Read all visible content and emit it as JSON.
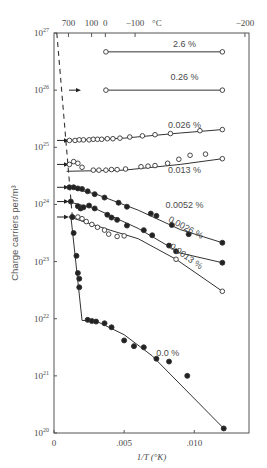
{
  "chart_data": {
    "type": "scatter",
    "title": "",
    "xlabel": "1/T (°K)",
    "ylabel": "Charge carriers per/m³",
    "x_scale": "linear",
    "y_scale": "log",
    "xlim": [
      0,
      0.0139
    ],
    "ylim": [
      1e+20,
      1e+27
    ],
    "x_ticks": [
      {
        "value": 0,
        "label": "0"
      },
      {
        "value": 0.005,
        "label": ".005"
      },
      {
        "value": 0.01,
        "label": ".010"
      }
    ],
    "y_ticks": [
      {
        "exp": 27,
        "label": "10",
        "sup": "27"
      },
      {
        "exp": 26,
        "label": "10",
        "sup": "26"
      },
      {
        "exp": 25,
        "label": "10",
        "sup": "25"
      },
      {
        "exp": 24,
        "label": "10",
        "sup": "24"
      },
      {
        "exp": 23,
        "label": "10",
        "sup": "23"
      },
      {
        "exp": 22,
        "label": "10",
        "sup": "22"
      },
      {
        "exp": 21,
        "label": "10",
        "sup": "21"
      },
      {
        "exp": 20,
        "label": "10",
        "sup": "20"
      }
    ],
    "top_axis": {
      "unit": "°C",
      "ticks": [
        {
          "label": "700",
          "inv_T": 0.00103
        },
        {
          "label": "100",
          "inv_T": 0.00268
        },
        {
          "label": "0",
          "inv_T": 0.00366
        },
        {
          "label": "−100",
          "inv_T": 0.00578
        },
        {
          "label": "−200",
          "inv_T": 0.01361
        }
      ]
    },
    "grid": false,
    "legend": "inline labels",
    "series": [
      {
        "name": "2.6 %",
        "marker": "open",
        "label_pos": [
          0.0093,
          26.75
        ],
        "points": [
          [
            0.0037,
            26.67
          ],
          [
            0.012,
            26.67
          ]
        ],
        "curve": [
          [
            0.0037,
            26.67
          ],
          [
            0.012,
            26.67
          ]
        ]
      },
      {
        "name": "0.26 %",
        "marker": "open",
        "label_pos": [
          0.0093,
          26.17
        ],
        "points": [
          [
            0.0037,
            26.0
          ],
          [
            0.012,
            26.0
          ]
        ],
        "curve": [
          [
            0.0037,
            26.0
          ],
          [
            0.012,
            26.0
          ]
        ]
      },
      {
        "name": "0.026 %",
        "marker": "open",
        "label_pos": [
          0.0093,
          25.33
        ],
        "points": [
          [
            0.0011,
            25.12
          ],
          [
            0.0015,
            25.12
          ],
          [
            0.0018,
            25.13
          ],
          [
            0.0021,
            25.13
          ],
          [
            0.0025,
            25.13
          ],
          [
            0.0028,
            25.14
          ],
          [
            0.0031,
            25.14
          ],
          [
            0.0034,
            25.14
          ],
          [
            0.0038,
            25.15
          ],
          [
            0.0042,
            25.15
          ],
          [
            0.0047,
            25.16
          ],
          [
            0.0054,
            25.18
          ],
          [
            0.0063,
            25.2
          ],
          [
            0.0072,
            25.22
          ],
          [
            0.0083,
            25.24
          ],
          [
            0.0104,
            25.29
          ],
          [
            0.012,
            25.31
          ]
        ],
        "curve": [
          [
            0.0009,
            25.12
          ],
          [
            0.005,
            25.16
          ],
          [
            0.009,
            25.25
          ],
          [
            0.012,
            25.31
          ]
        ]
      },
      {
        "name": "0.013 %",
        "marker": "open",
        "label_pos": [
          0.0093,
          24.55
        ],
        "points": [
          [
            0.0011,
            24.7
          ],
          [
            0.0014,
            24.75
          ],
          [
            0.0017,
            24.72
          ],
          [
            0.002,
            24.65
          ],
          [
            0.0028,
            24.6
          ],
          [
            0.0032,
            24.6
          ],
          [
            0.0037,
            24.6
          ],
          [
            0.0041,
            24.61
          ],
          [
            0.0045,
            24.61
          ],
          [
            0.0051,
            24.62
          ],
          [
            0.0062,
            24.66
          ],
          [
            0.0067,
            24.67
          ],
          [
            0.0072,
            24.68
          ],
          [
            0.0081,
            24.72
          ],
          [
            0.0089,
            24.79
          ],
          [
            0.0097,
            24.86
          ],
          [
            0.0108,
            24.88
          ],
          [
            0.012,
            24.8
          ]
        ],
        "curve": [
          [
            0.0009,
            24.58
          ],
          [
            0.005,
            24.6
          ],
          [
            0.009,
            24.7
          ],
          [
            0.012,
            24.8
          ]
        ]
      },
      {
        "name": "0.0052 %",
        "marker": "filled",
        "label_pos": [
          0.0093,
          23.93
        ],
        "points": [
          [
            0.0011,
            24.3
          ],
          [
            0.0014,
            24.3
          ],
          [
            0.0017,
            24.28
          ],
          [
            0.002,
            24.27
          ],
          [
            0.0024,
            24.23
          ],
          [
            0.0029,
            24.18
          ],
          [
            0.0036,
            24.12
          ],
          [
            0.0046,
            24.03
          ],
          [
            0.0052,
            23.96
          ],
          [
            0.0069,
            23.84
          ],
          [
            0.0073,
            23.8
          ],
          [
            0.0084,
            23.64
          ],
          [
            0.0096,
            23.48
          ],
          [
            0.012,
            23.33
          ]
        ],
        "curve": [
          [
            0.001,
            24.3
          ],
          [
            0.003,
            24.18
          ],
          [
            0.006,
            23.9
          ],
          [
            0.009,
            23.56
          ],
          [
            0.012,
            23.33
          ]
        ]
      },
      {
        "name": "0.0026 %",
        "marker": "filled",
        "label_pos": [
          0.0093,
          23.55
        ],
        "label_rotation": 28,
        "points": [
          [
            0.0012,
            24.05
          ],
          [
            0.0017,
            23.97
          ],
          [
            0.0019,
            23.93
          ],
          [
            0.0021,
            23.95
          ],
          [
            0.0025,
            23.98
          ],
          [
            0.0029,
            23.93
          ],
          [
            0.0038,
            23.82
          ],
          [
            0.0041,
            23.77
          ],
          [
            0.0045,
            23.73
          ],
          [
            0.0052,
            23.63
          ],
          [
            0.0064,
            23.55
          ],
          [
            0.007,
            23.46
          ],
          [
            0.0082,
            23.28
          ],
          [
            0.0087,
            23.18
          ],
          [
            0.012,
            22.98
          ]
        ],
        "curve": [
          [
            0.001,
            24.05
          ],
          [
            0.003,
            23.92
          ],
          [
            0.006,
            23.58
          ],
          [
            0.009,
            23.15
          ],
          [
            0.012,
            22.98
          ]
        ]
      },
      {
        "name": "0.0013 %",
        "marker": "open",
        "label_pos": [
          0.0093,
          23.05
        ],
        "label_rotation": 35,
        "points": [
          [
            0.0013,
            23.78
          ],
          [
            0.0017,
            23.78
          ],
          [
            0.002,
            23.75
          ],
          [
            0.0023,
            23.7
          ],
          [
            0.0027,
            23.65
          ],
          [
            0.0031,
            23.6
          ],
          [
            0.0036,
            23.55
          ],
          [
            0.0039,
            23.48
          ],
          [
            0.0045,
            23.44
          ],
          [
            0.005,
            23.45
          ],
          [
            0.0087,
            23.04
          ],
          [
            0.012,
            22.48
          ]
        ],
        "curve": [
          [
            0.0011,
            23.78
          ],
          [
            0.004,
            23.55
          ],
          [
            0.006,
            23.4
          ],
          [
            0.0087,
            23.04
          ],
          [
            0.012,
            22.48
          ]
        ]
      },
      {
        "name": "0.0 %",
        "marker": "filled",
        "label_pos": [
          0.0081,
          21.35
        ],
        "points": [
          [
            0.0013,
            23.78
          ],
          [
            0.0014,
            23.5
          ],
          [
            0.0016,
            23.1
          ],
          [
            0.0017,
            22.8
          ],
          [
            0.0018,
            22.7
          ],
          [
            0.0018,
            22.55
          ],
          [
            0.0024,
            21.98
          ],
          [
            0.0027,
            21.96
          ],
          [
            0.003,
            21.95
          ],
          [
            0.0036,
            21.92
          ],
          [
            0.0041,
            21.85
          ],
          [
            0.005,
            21.62
          ],
          [
            0.0057,
            21.52
          ],
          [
            0.0064,
            21.5
          ],
          [
            0.0073,
            21.3
          ],
          [
            0.0082,
            21.25
          ],
          [
            0.0095,
            21.0
          ],
          [
            0.0121,
            20.08
          ]
        ],
        "curve": [
          [
            0.0012,
            23.8
          ],
          [
            0.002,
            21.97
          ],
          [
            0.003,
            21.96
          ],
          [
            0.005,
            21.72
          ],
          [
            0.007,
            21.35
          ],
          [
            0.0121,
            20.08
          ]
        ]
      }
    ],
    "annotations": {
      "dashed_intrinsic_line": [
        [
          0.0002,
          27.0
        ],
        [
          0.0013,
          23.8
        ]
      ],
      "arrows_at_y": [
        26.0,
        25.12,
        24.7,
        24.3,
        24.05,
        23.78
      ]
    }
  }
}
